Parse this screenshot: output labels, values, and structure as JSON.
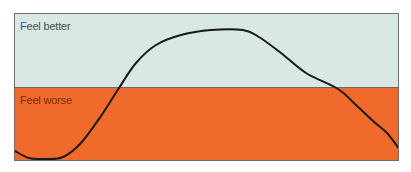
{
  "chart_data": {
    "type": "line",
    "title": "",
    "xlabel": "",
    "ylabel": "",
    "bands": [
      {
        "label": "Feel better",
        "color": "#d9e8e2",
        "position": "upper"
      },
      {
        "label": "Feel worse",
        "color": "#f06a2c",
        "position": "lower"
      }
    ],
    "series": [
      {
        "name": "mood",
        "color": "#1a1a1a",
        "points_px": [
          [
            14,
            150
          ],
          [
            28,
            157
          ],
          [
            45,
            158
          ],
          [
            62,
            156
          ],
          [
            80,
            142
          ],
          [
            100,
            115
          ],
          [
            118,
            87
          ],
          [
            135,
            62
          ],
          [
            155,
            44
          ],
          [
            180,
            34
          ],
          [
            210,
            29
          ],
          [
            242,
            29
          ],
          [
            258,
            36
          ],
          [
            280,
            52
          ],
          [
            305,
            72
          ],
          [
            337,
            88
          ],
          [
            355,
            104
          ],
          [
            372,
            120
          ],
          [
            386,
            132
          ],
          [
            399,
            149
          ]
        ]
      }
    ],
    "grid": false,
    "legend": "none"
  },
  "labels": {
    "better_first": "F",
    "better_rest": "eel better",
    "worse": "Feel worse"
  }
}
